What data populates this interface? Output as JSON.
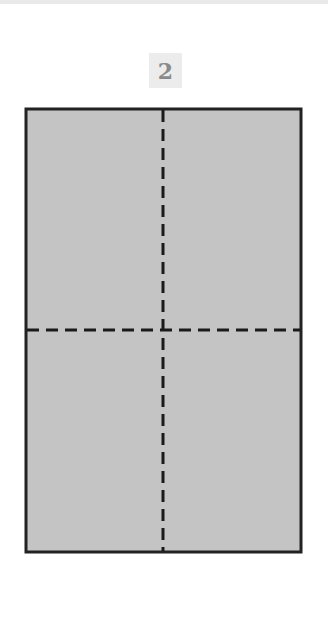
{
  "step": {
    "number": "2"
  },
  "diagram": {
    "paper_color": "#c4c4c4",
    "outline_color": "#222222",
    "fold_line_color": "#1a1a1a",
    "rect": {
      "x": 26,
      "y": 109,
      "width": 275,
      "height": 443
    },
    "fold_lines": [
      {
        "orientation": "vertical",
        "x": 163,
        "style": "dashed"
      },
      {
        "orientation": "horizontal",
        "y": 330,
        "style": "dashed"
      }
    ]
  }
}
